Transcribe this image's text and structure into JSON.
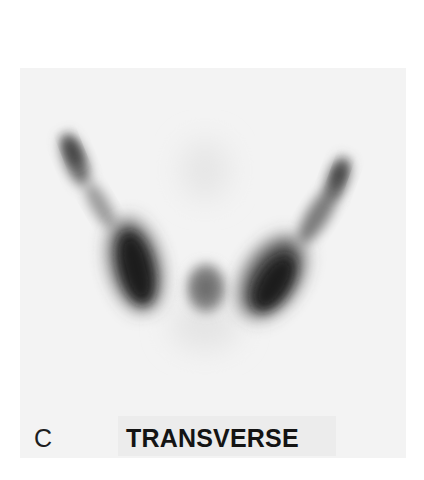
{
  "figure": {
    "panel_letter": "C",
    "view_title": "TRANSVERSE",
    "image_type": "scintigraphy",
    "colors": {
      "background": "#ffffff",
      "panel": "#f3f3f3",
      "uptake_dark": "#1a1a1a",
      "text": "#141414"
    }
  }
}
